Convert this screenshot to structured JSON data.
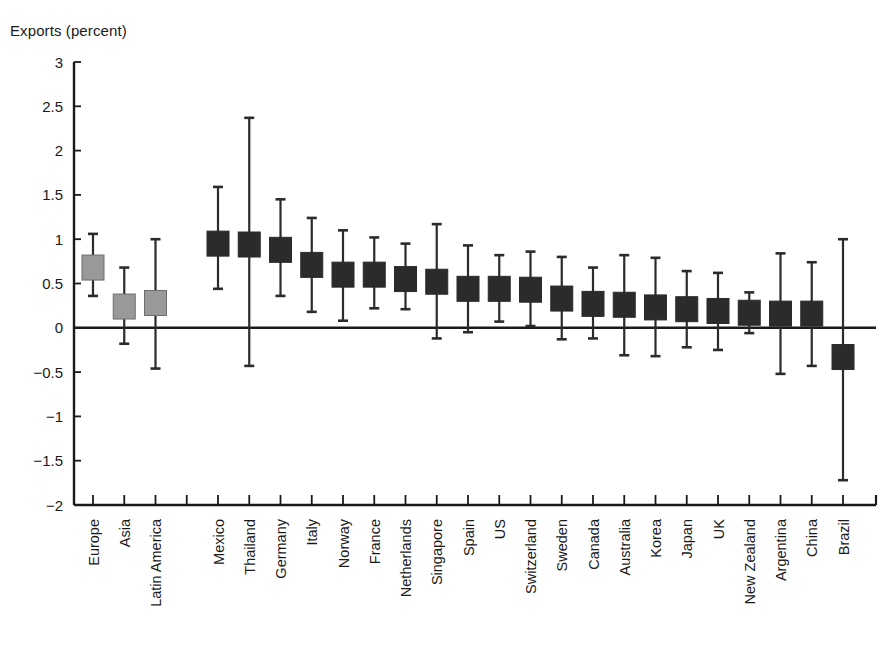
{
  "chart_data": {
    "type": "bar",
    "title": "",
    "ylabel": "Exports (percent)",
    "xlabel": "",
    "ylim": [
      -2,
      3
    ],
    "yticks": [
      3,
      2.5,
      2,
      1.5,
      1,
      0.5,
      0,
      -0.5,
      -1,
      -1.5,
      -2
    ],
    "ytick_labels": [
      "3",
      "2.5",
      "2",
      "1.5",
      "1",
      "0.5",
      "0",
      "−0.5",
      "−1",
      "−1.5",
      "−2"
    ],
    "grid": false,
    "legend": null,
    "zero_line": 0,
    "colors": {
      "aggregate": "#999999",
      "country": "#2b2b2b",
      "axis": "#1a1a1a"
    },
    "categories": [
      "Europe",
      "Asia",
      "Latin America",
      "",
      "Mexico",
      "Thailand",
      "Germany",
      "Italy",
      "Norway",
      "France",
      "Netherlands",
      "Singapore",
      "Spain",
      "US",
      "Switzerland",
      "Sweden",
      "Canada",
      "Australia",
      "Korea",
      "Japan",
      "UK",
      "New Zealand",
      "Argentina",
      "China",
      "Brazil"
    ],
    "series": [
      {
        "name": "Exports (percent)",
        "points": [
          {
            "category": "Europe",
            "group": "aggregate",
            "value": 0.68,
            "low": 0.36,
            "high": 1.06
          },
          {
            "category": "Asia",
            "group": "aggregate",
            "value": 0.24,
            "low": -0.18,
            "high": 0.68
          },
          {
            "category": "Latin America",
            "group": "aggregate",
            "value": 0.28,
            "low": -0.46,
            "high": 1.0
          },
          {
            "category": "",
            "group": "spacer",
            "value": null,
            "low": null,
            "high": null
          },
          {
            "category": "Mexico",
            "group": "country",
            "value": 0.95,
            "low": 0.44,
            "high": 1.59
          },
          {
            "category": "Thailand",
            "group": "country",
            "value": 0.94,
            "low": -0.43,
            "high": 2.37
          },
          {
            "category": "Germany",
            "group": "country",
            "value": 0.88,
            "low": 0.36,
            "high": 1.45
          },
          {
            "category": "Italy",
            "group": "country",
            "value": 0.71,
            "low": 0.18,
            "high": 1.24
          },
          {
            "category": "Norway",
            "group": "country",
            "value": 0.6,
            "low": 0.08,
            "high": 1.1
          },
          {
            "category": "France",
            "group": "country",
            "value": 0.6,
            "low": 0.22,
            "high": 1.02
          },
          {
            "category": "Netherlands",
            "group": "country",
            "value": 0.55,
            "low": 0.21,
            "high": 0.95
          },
          {
            "category": "Singapore",
            "group": "country",
            "value": 0.52,
            "low": -0.12,
            "high": 1.17
          },
          {
            "category": "Spain",
            "group": "country",
            "value": 0.44,
            "low": -0.05,
            "high": 0.93
          },
          {
            "category": "US",
            "group": "country",
            "value": 0.44,
            "low": 0.07,
            "high": 0.82
          },
          {
            "category": "Switzerland",
            "group": "country",
            "value": 0.43,
            "low": 0.02,
            "high": 0.86
          },
          {
            "category": "Sweden",
            "group": "country",
            "value": 0.33,
            "low": -0.13,
            "high": 0.8
          },
          {
            "category": "Canada",
            "group": "country",
            "value": 0.27,
            "low": -0.12,
            "high": 0.68
          },
          {
            "category": "Australia",
            "group": "country",
            "value": 0.26,
            "low": -0.31,
            "high": 0.82
          },
          {
            "category": "Korea",
            "group": "country",
            "value": 0.23,
            "low": -0.32,
            "high": 0.79
          },
          {
            "category": "Japan",
            "group": "country",
            "value": 0.21,
            "low": -0.22,
            "high": 0.64
          },
          {
            "category": "UK",
            "group": "country",
            "value": 0.19,
            "low": -0.25,
            "high": 0.62
          },
          {
            "category": "New Zealand",
            "group": "country",
            "value": 0.17,
            "low": -0.06,
            "high": 0.4
          },
          {
            "category": "Argentina",
            "group": "country",
            "value": 0.16,
            "low": -0.52,
            "high": 0.84
          },
          {
            "category": "China",
            "group": "country",
            "value": 0.16,
            "low": -0.43,
            "high": 0.74
          },
          {
            "category": "Brazil",
            "group": "country",
            "value": -0.33,
            "low": -1.72,
            "high": 1.0
          }
        ]
      }
    ]
  }
}
